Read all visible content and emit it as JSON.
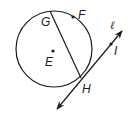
{
  "diagram": {
    "type": "circle-with-chord-and-tangent",
    "colors": {
      "stroke": "#1a1a1a",
      "background": "#ffffff"
    },
    "circle": {
      "center_label": "E",
      "cx": 54,
      "cy": 49,
      "r": 38
    },
    "points": {
      "E": {
        "label": "E",
        "x": 53,
        "y": 51
      },
      "F": {
        "label": "F",
        "x": 73,
        "y": 17
      },
      "G": {
        "label": "G",
        "x": 50,
        "y": 11
      },
      "H": {
        "label": "H",
        "x": 81,
        "y": 78
      },
      "I": {
        "label": "I",
        "x": 111,
        "y": 44
      }
    },
    "chord": {
      "label": "GH",
      "from": "G",
      "to": "H"
    },
    "tangent_line": {
      "label": "ℓ",
      "through": [
        "H",
        "I"
      ],
      "arrows": "both"
    }
  }
}
